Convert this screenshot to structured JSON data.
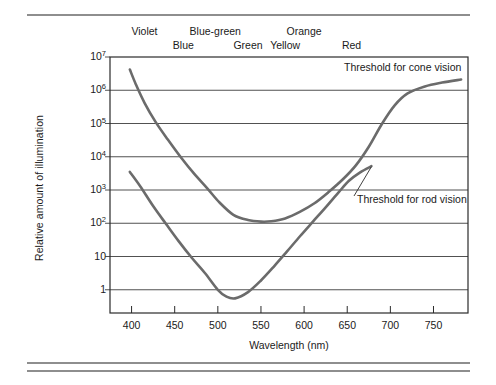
{
  "figure": {
    "rules": [
      "top-rule",
      "bottom-rule-1",
      "bottom-rule-2"
    ]
  },
  "chart_data": {
    "type": "line",
    "title": "",
    "xlabel": "Wavelength (nm)",
    "ylabel": "Relative amount of illumination",
    "xlim": [
      375,
      790
    ],
    "ylim": [
      0.2,
      10000000
    ],
    "yscale": "log",
    "grid": "horizontal",
    "legend_position": "inline-annotation",
    "xticks": [
      400,
      450,
      500,
      550,
      600,
      650,
      700,
      750
    ],
    "xtick_labels": [
      "400",
      "450",
      "500",
      "550",
      "600",
      "650",
      "700",
      "750"
    ],
    "yticks": [
      1,
      10,
      100,
      1000,
      10000,
      100000,
      1000000,
      10000000
    ],
    "ytick_labels": [
      "1",
      "10",
      "10<sup>2</sup>",
      "10<sup>3</sup>",
      "10<sup>4</sup>",
      "10<sup>5</sup>",
      "10<sup>6</sup>",
      "10<sup>7</sup>"
    ],
    "color_band_labels": [
      {
        "text": "Violet",
        "wavelength": 415,
        "row": 1
      },
      {
        "text": "Blue",
        "wavelength": 460,
        "row": 2
      },
      {
        "text": "Blue-green",
        "wavelength": 497,
        "row": 1
      },
      {
        "text": "Green",
        "wavelength": 535,
        "row": 2
      },
      {
        "text": "Orange",
        "wavelength": 600,
        "row": 1
      },
      {
        "text": "Yellow",
        "wavelength": 578,
        "row": 2
      },
      {
        "text": "Red",
        "wavelength": 655,
        "row": 2
      }
    ],
    "annotations": [
      {
        "text": "Threshold for cone vision",
        "target_wavelength": 735,
        "target_value": 1200000
      },
      {
        "text": "Threshold for rod vision",
        "target_wavelength": 678,
        "target_value": 5000
      }
    ],
    "series": [
      {
        "name": "Threshold for rod vision",
        "color": "#6b6b6b",
        "x": [
          398,
          410,
          425,
          440,
          455,
          470,
          485,
          500,
          510,
          520,
          535,
          550,
          565,
          580,
          595,
          610,
          625,
          640,
          652,
          665,
          678
        ],
        "y": [
          3500,
          1300,
          330,
          95,
          28,
          9,
          3.2,
          1.0,
          0.62,
          0.55,
          0.85,
          1.9,
          5.0,
          14,
          40,
          110,
          300,
          850,
          1900,
          3400,
          5200
        ]
      },
      {
        "name": "Threshold for cone vision",
        "color": "#6b6b6b",
        "x": [
          398,
          405,
          415,
          428,
          442,
          458,
          472,
          488,
          502,
          518,
          535,
          550,
          562,
          578,
          595,
          612,
          628,
          645,
          660,
          675,
          690,
          705,
          720,
          740,
          760,
          782
        ],
        "y": [
          4200000,
          1500000,
          420000,
          110000,
          33000,
          9000,
          3200,
          1100,
          420,
          180,
          125,
          112,
          115,
          140,
          220,
          400,
          850,
          2100,
          5500,
          20000,
          95000,
          350000,
          800000,
          1300000,
          1700000,
          2100000
        ]
      }
    ]
  }
}
